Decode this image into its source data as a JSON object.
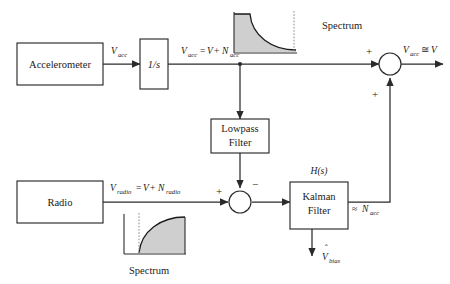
{
  "diagram": {
    "blocks": [
      {
        "id": "accelerometer",
        "label": "Accelerometer"
      },
      {
        "id": "integrator",
        "label": "1/s"
      },
      {
        "id": "lowpass",
        "label_line1": "Lowpass",
        "label_line2": "Filter"
      },
      {
        "id": "radio",
        "label": "Radio"
      },
      {
        "id": "kalman",
        "label_line1": "Kalman",
        "label_line2": "Filter"
      }
    ],
    "signals": {
      "accel_out": {
        "var": "V",
        "sub": "acc"
      },
      "integrator_out_lhs_var": "V",
      "integrator_out_lhs_sub": "acc",
      "integrator_out_eq": "=",
      "integrator_out_rhs_var": "V",
      "integrator_out_plus": "+",
      "integrator_out_noise_var": "N",
      "integrator_out_noise_sub": "acc",
      "radio_out_lhs_var": "V",
      "radio_out_lhs_sub": "radio",
      "radio_out_eq": "=",
      "radio_out_rhs_var": "V",
      "radio_out_plus": "+",
      "radio_out_noise_var": "N",
      "radio_out_noise_sub": "radio",
      "top_sum_out_lhs_var": "V",
      "top_sum_out_lhs_sub": "acc",
      "top_sum_out_approx": "≅",
      "top_sum_out_rhs_var": "V",
      "kalman_feedback_approx": "≈",
      "kalman_feedback_var": "N",
      "kalman_feedback_sub": "acc",
      "kalman_bias_var": "V",
      "kalman_bias_hat": "ˆ",
      "kalman_bias_sub": "bias",
      "transfer_function": "H(s)"
    },
    "signs": {
      "top_sum_left": "+",
      "top_sum_bottom": "+",
      "bottom_sum_left": "+",
      "bottom_sum_top": "−"
    },
    "spectra": [
      {
        "id": "spectrum-top",
        "label": "Spectrum",
        "shape": "lowpass-decaying",
        "description": "Spectral magnitude decaying with frequency, gray shaded area under curve, dotted vertical cutoff line at right"
      },
      {
        "id": "spectrum-bottom",
        "label": "Spectrum",
        "shape": "highpass-rising",
        "description": "Spectral magnitude rising with frequency, gray shaded area under curve, dotted vertical cutoff line at left"
      }
    ],
    "colors": {
      "line": "#2b2b2b",
      "text": "#1a1a1a",
      "spectrum_fill": "#cfcfcf",
      "dotted_line": "#8a8a8a",
      "background": "#ffffff"
    }
  }
}
